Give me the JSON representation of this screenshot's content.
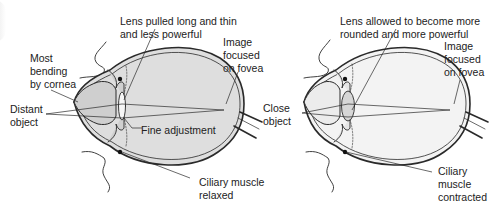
{
  "diagram": {
    "colors": {
      "outline": "#2a2a2a",
      "left_eye_fill": "#dedede",
      "left_eye_front_fill": "#cfcfcf",
      "right_eye_fill": "#f3f3f3",
      "right_eye_front_fill": "#ebebeb",
      "lens_left": "#f4f4f4",
      "lens_right": "#d6d6d6",
      "label_text": "#222222"
    },
    "left_eye": {
      "name": "distant-vision",
      "labels": {
        "lens": "Lens pulled long and thin\nand less powerful",
        "cornea": "Most\nbending\nby cornea",
        "image": "Image\nfocused\non fovea",
        "object": "Distant\nobject",
        "fine": "Fine adjustment",
        "muscle": "Ciliary muscle\nrelaxed"
      }
    },
    "right_eye": {
      "name": "near-vision",
      "labels": {
        "lens": "Lens allowed to become more\nrounded and more powerful",
        "image": "Image\nfocused\non fovea",
        "object": "Close\nobject",
        "muscle": "Ciliary\nmuscle\ncontracted"
      }
    }
  }
}
